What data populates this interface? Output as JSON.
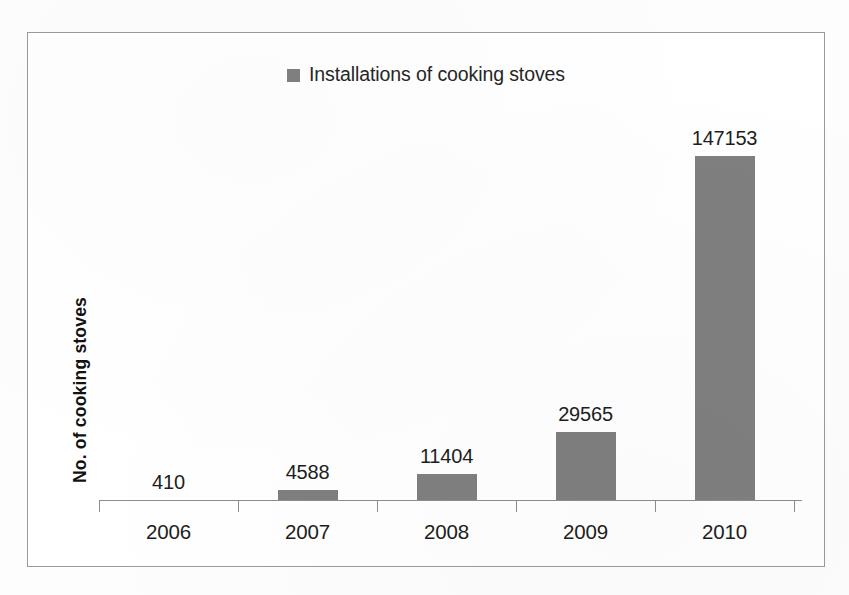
{
  "chart_data": {
    "type": "bar",
    "title": "",
    "subtitle": "",
    "xlabel": "",
    "ylabel": "No. of cooking stoves",
    "categories": [
      "2006",
      "2007",
      "2008",
      "2009",
      "2010"
    ],
    "values": [
      410,
      4588,
      11404,
      29565,
      147153
    ],
    "value_labels": [
      "410",
      "4588",
      "11404",
      "29565",
      "147153"
    ],
    "series": [
      {
        "name": "Installations of cooking stoves",
        "values": [
          410,
          4588,
          11404,
          29565,
          147153
        ],
        "color": "#7f7f7f"
      }
    ],
    "ylim": [
      0,
      160000
    ],
    "grid": false,
    "legend_position": "top-center",
    "y_axis_ticks_visible": false,
    "data_labels_shown": true
  },
  "legend": {
    "label": "Installations of cooking stoves",
    "swatch_color": "#808080"
  },
  "axes": {
    "y_title": "No. of cooking stoves",
    "x_tick_labels": [
      "2006",
      "2007",
      "2008",
      "2009",
      "2010"
    ],
    "axis_color": "#8d8d8d"
  },
  "bars": [
    {
      "category": "2006",
      "value": 410,
      "label": "410",
      "color": "#7f7f7f"
    },
    {
      "category": "2007",
      "value": 4588,
      "label": "4588",
      "color": "#7f7f7f"
    },
    {
      "category": "2008",
      "value": 11404,
      "label": "11404",
      "color": "#7f7f7f"
    },
    {
      "category": "2009",
      "value": 29565,
      "label": "29565",
      "color": "#7f7f7f"
    },
    {
      "category": "2010",
      "value": 147153,
      "label": "147153",
      "color": "#7f7f7f"
    }
  ],
  "frame": {
    "border_color": "#9a9a9a",
    "background": "#ffffff"
  }
}
